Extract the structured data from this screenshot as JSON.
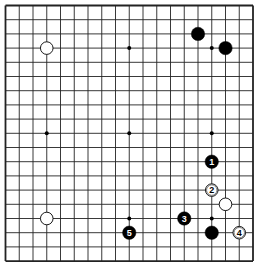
{
  "board": {
    "size": 19,
    "origin_x": 5.5,
    "origin_y": 5.5,
    "spacing_x": 13.75,
    "spacing_y": 14.2,
    "line_color": "#222222",
    "background": "#ffffff",
    "star_points": [
      [
        3,
        3
      ],
      [
        9,
        3
      ],
      [
        15,
        3
      ],
      [
        3,
        9
      ],
      [
        9,
        9
      ],
      [
        15,
        9
      ],
      [
        3,
        15
      ],
      [
        9,
        15
      ],
      [
        15,
        15
      ]
    ]
  },
  "stones": [
    {
      "color": "white",
      "col": 3,
      "row": 3,
      "label": ""
    },
    {
      "color": "black",
      "col": 14,
      "row": 2,
      "label": ""
    },
    {
      "color": "black",
      "col": 16,
      "row": 3,
      "label": ""
    },
    {
      "color": "white",
      "col": 3,
      "row": 15,
      "label": ""
    },
    {
      "color": "black",
      "col": 15,
      "row": 16,
      "label": ""
    },
    {
      "color": "white",
      "col": 16,
      "row": 14,
      "label": ""
    },
    {
      "color": "black",
      "col": 15,
      "row": 11,
      "label": "1"
    },
    {
      "color": "white",
      "col": 15,
      "row": 13,
      "label": "2"
    },
    {
      "color": "black",
      "col": 13,
      "row": 15,
      "label": "3"
    },
    {
      "color": "white",
      "col": 17,
      "row": 16,
      "label": "4"
    },
    {
      "color": "black",
      "col": 9,
      "row": 16,
      "label": "5"
    }
  ]
}
